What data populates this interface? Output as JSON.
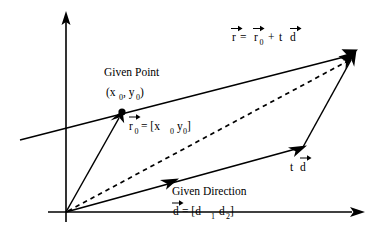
{
  "figure": {
    "title_equation": "r = r0 + t d",
    "background_color": "#ffffff",
    "stroke_color": "#000000",
    "width": 383,
    "height": 234
  },
  "labels": {
    "equation": {
      "r": "r",
      "equals": "=",
      "r0_base": "r",
      "r0_sub": "0",
      "plus": "+",
      "t": "t",
      "d": "d"
    },
    "given_point": {
      "line1": "Given Point",
      "paren_open": "(x",
      "sub1": "0",
      "comma": ", y",
      "sub2": "0",
      "paren_close": ")"
    },
    "r0_vector": {
      "base": "r",
      "sub": "0",
      "rest": "= [x",
      "sub_x": "0",
      "mid": "y",
      "sub_y": "0",
      "close": "]"
    },
    "given_direction": {
      "line1": "Given Direction",
      "d": "d",
      "equals": "= [d",
      "sub1": "1",
      "space": "d",
      "sub2": "2",
      "close": "]"
    },
    "td_vector": {
      "t": "t",
      "d": "d"
    },
    "axes": {
      "x_axis": "x-axis",
      "y_axis": "y-axis"
    }
  },
  "geometry": {
    "origin": {
      "x": 66,
      "y": 212
    },
    "x_axis_end": {
      "x": 362,
      "y": 212
    },
    "y_axis_top": {
      "x": 66,
      "y": 14
    },
    "given_point": {
      "x": 122,
      "y": 112
    },
    "tip": {
      "x": 355,
      "y": 52
    },
    "direction_end": {
      "x": 303,
      "y": 147
    },
    "line_left_end": {
      "x": 20,
      "y": 140
    }
  }
}
